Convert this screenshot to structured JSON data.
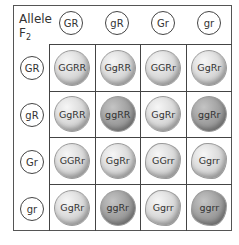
{
  "corner": {
    "label": "Allele",
    "generation": "F",
    "generation_sub": "2"
  },
  "column_headers": [
    "GR",
    "gR",
    "Gr",
    "gr"
  ],
  "row_headers": [
    "GR",
    "gR",
    "Gr",
    "gr"
  ],
  "colors": {
    "yellow_pea": "#dcdcdc",
    "green_pea": "#a2a2a2",
    "border": "#444444"
  },
  "cells": [
    [
      {
        "genotype": "GGRR",
        "type": "yellow round"
      },
      {
        "genotype": "GgRR",
        "type": "yellow round"
      },
      {
        "genotype": "GGRr",
        "type": "yellow round"
      },
      {
        "genotype": "GgRr",
        "type": "yellow round"
      }
    ],
    [
      {
        "genotype": "GgRR",
        "type": "yellow round"
      },
      {
        "genotype": "ggRR",
        "type": "green round"
      },
      {
        "genotype": "GgRr",
        "type": "yellow round"
      },
      {
        "genotype": "ggRr",
        "type": "green round"
      }
    ],
    [
      {
        "genotype": "GGRr",
        "type": "yellow round"
      },
      {
        "genotype": "GgRr",
        "type": "yellow round"
      },
      {
        "genotype": "GGrr",
        "type": "yellow wrinkled"
      },
      {
        "genotype": "Ggrr",
        "type": "yellow wrinkled"
      }
    ],
    [
      {
        "genotype": "GgRr",
        "type": "yellow round"
      },
      {
        "genotype": "ggRr",
        "type": "green round"
      },
      {
        "genotype": "Ggrr",
        "type": "yellow wrinkled"
      },
      {
        "genotype": "ggrr",
        "type": "green wrinkled"
      }
    ]
  ]
}
